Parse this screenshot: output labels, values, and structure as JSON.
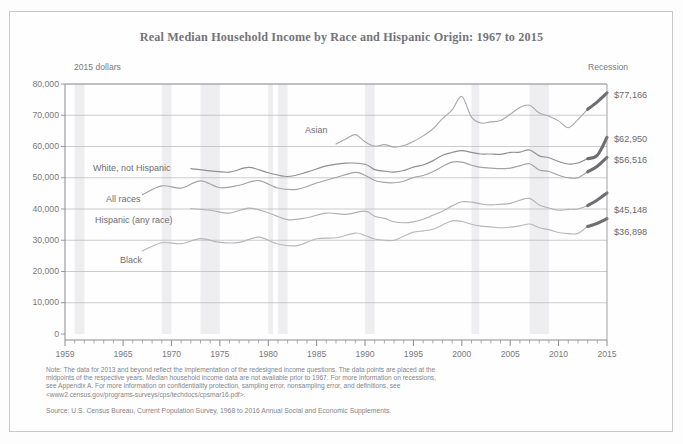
{
  "chart_data": {
    "type": "line",
    "title": "Real Median Household Income by Race and Hispanic Origin: 1967 to 2015",
    "units_label": "2015 dollars",
    "xlabel": "",
    "ylabel": "",
    "xlim": [
      1959,
      2015
    ],
    "ylim": [
      0,
      80000
    ],
    "grid": true,
    "legend_position": "inline-right",
    "legend_recession": "Recession",
    "y_ticks": [
      "0",
      "10,000",
      "20,000",
      "30,000",
      "40,000",
      "50,000",
      "60,000",
      "70,000",
      "80,000"
    ],
    "y_tick_values": [
      0,
      10000,
      20000,
      30000,
      40000,
      50000,
      60000,
      70000,
      80000
    ],
    "x_ticks": [
      "1959",
      "1965",
      "1970",
      "1975",
      "1980",
      "1985",
      "1990",
      "1995",
      "2000",
      "2005",
      "2010",
      "2015"
    ],
    "x_tick_values": [
      1959,
      1965,
      1970,
      1975,
      1980,
      1985,
      1990,
      1995,
      2000,
      2005,
      2010,
      2015
    ],
    "recession_bands": [
      [
        1960,
        1961
      ],
      [
        1969,
        1970
      ],
      [
        1973,
        1975
      ],
      [
        1980,
        1980.5
      ],
      [
        1981,
        1982
      ],
      [
        1990,
        1991
      ],
      [
        2001,
        2001.8
      ],
      [
        2007,
        2009
      ]
    ],
    "series": [
      {
        "name": "Asian",
        "label": "Asian",
        "end_value_label": "$77,166",
        "end_value": 77166,
        "color": "#a9a9ad",
        "x": [
          1987,
          1988,
          1989,
          1990,
          1991,
          1992,
          1993,
          1994,
          1995,
          1996,
          1997,
          1998,
          1999,
          2000,
          2001,
          2002,
          2003,
          2004,
          2005,
          2006,
          2007,
          2008,
          2009,
          2010,
          2011,
          2012,
          2013,
          2014,
          2015
        ],
        "values": [
          60800,
          62400,
          63800,
          61500,
          60100,
          60600,
          59800,
          60300,
          61600,
          63400,
          65600,
          68900,
          71700,
          76000,
          69400,
          67500,
          67900,
          68300,
          70300,
          72500,
          73200,
          70700,
          69700,
          68200,
          66000,
          68600,
          71900,
          74300,
          77166
        ]
      },
      {
        "name": "White, not Hispanic",
        "label": "White, not Hispanic",
        "end_value_label": "$62,950",
        "end_value": 62950,
        "color": "#8f8f94",
        "x": [
          1972,
          1974,
          1976,
          1978,
          1980,
          1982,
          1984,
          1986,
          1988,
          1990,
          1991,
          1992,
          1993,
          1994,
          1995,
          1996,
          1997,
          1998,
          1999,
          2000,
          2001,
          2002,
          2003,
          2004,
          2005,
          2006,
          2007,
          2008,
          2009,
          2010,
          2011,
          2012,
          2013,
          2014,
          2015
        ],
        "values": [
          52900,
          52200,
          51800,
          53300,
          51600,
          50400,
          51800,
          53800,
          54700,
          54300,
          52600,
          52100,
          51800,
          52300,
          53400,
          54100,
          55400,
          57200,
          58100,
          58700,
          58100,
          57600,
          57600,
          57500,
          58100,
          58200,
          58900,
          57000,
          56400,
          55200,
          54400,
          54700,
          56100,
          57200,
          62950
        ]
      },
      {
        "name": "All races",
        "label": "All races",
        "end_value_label": "$56,516",
        "end_value": 56516,
        "color": "#a3a3a8",
        "x": [
          1967,
          1969,
          1971,
          1973,
          1975,
          1977,
          1979,
          1981,
          1983,
          1985,
          1987,
          1989,
          1990,
          1991,
          1992,
          1993,
          1994,
          1995,
          1996,
          1997,
          1998,
          1999,
          2000,
          2001,
          2002,
          2003,
          2004,
          2005,
          2006,
          2007,
          2008,
          2009,
          2010,
          2011,
          2012,
          2013,
          2014,
          2015
        ],
        "values": [
          44600,
          47400,
          46700,
          49000,
          46800,
          47600,
          49100,
          46700,
          46300,
          48300,
          50100,
          51700,
          50800,
          49100,
          48500,
          48400,
          48900,
          50100,
          50700,
          51900,
          53600,
          55000,
          55000,
          54000,
          53300,
          53100,
          52900,
          53100,
          53800,
          54500,
          52500,
          52000,
          50800,
          50000,
          50000,
          51900,
          53700,
          56516
        ]
      },
      {
        "name": "Hispanic (any race)",
        "label": "Hispanic (any race)",
        "end_value_label": "$45,148",
        "end_value": 45148,
        "color": "#b2b2b6",
        "x": [
          1972,
          1974,
          1976,
          1978,
          1980,
          1982,
          1984,
          1986,
          1988,
          1990,
          1991,
          1992,
          1993,
          1994,
          1995,
          1996,
          1997,
          1998,
          1999,
          2000,
          2001,
          2002,
          2003,
          2004,
          2005,
          2006,
          2007,
          2008,
          2009,
          2010,
          2011,
          2012,
          2013,
          2014,
          2015
        ],
        "values": [
          40100,
          39600,
          38700,
          40300,
          38800,
          36600,
          37200,
          38700,
          38300,
          39300,
          37700,
          37000,
          35900,
          35600,
          35900,
          36700,
          38000,
          39300,
          41000,
          42300,
          42200,
          41600,
          41300,
          41500,
          41800,
          42800,
          43400,
          41300,
          40300,
          39600,
          39900,
          40000,
          41100,
          42900,
          45148
        ]
      },
      {
        "name": "Black",
        "label": "Black",
        "end_value_label": "$36,898",
        "end_value": 36898,
        "color": "#b8b8bc",
        "x": [
          1967,
          1969,
          1971,
          1973,
          1975,
          1977,
          1979,
          1981,
          1983,
          1985,
          1987,
          1989,
          1990,
          1991,
          1992,
          1993,
          1994,
          1995,
          1996,
          1997,
          1998,
          1999,
          2000,
          2001,
          2002,
          2003,
          2004,
          2005,
          2006,
          2007,
          2008,
          2009,
          2010,
          2011,
          2012,
          2013,
          2014,
          2015
        ],
        "values": [
          26600,
          29200,
          28900,
          30500,
          29300,
          29300,
          31000,
          28800,
          28300,
          30500,
          30800,
          32300,
          31500,
          30400,
          30000,
          30000,
          31300,
          32600,
          33000,
          33500,
          34900,
          36200,
          36000,
          35100,
          34500,
          34300,
          34000,
          34200,
          34600,
          35200,
          34000,
          33400,
          32500,
          32100,
          32200,
          34400,
          35400,
          36898
        ]
      }
    ]
  },
  "series_label_positions": [
    {
      "name": "asian",
      "left": 305,
      "top": 125
    },
    {
      "name": "white-not-hispanic",
      "left": 93,
      "top": 163
    },
    {
      "name": "all-races",
      "left": 106,
      "top": 194
    },
    {
      "name": "hispanic-any-race",
      "left": 95,
      "top": 215
    },
    {
      "name": "black",
      "left": 120,
      "top": 255
    }
  ],
  "end_value_positions": [
    {
      "name": "asian",
      "left": 614,
      "top": 90
    },
    {
      "name": "white-not-hispanic",
      "left": 614,
      "top": 134
    },
    {
      "name": "all-races",
      "left": 614,
      "top": 155
    },
    {
      "name": "hispanic-any-race",
      "left": 614,
      "top": 205
    },
    {
      "name": "black",
      "left": 614,
      "top": 227
    }
  ],
  "footnote": {
    "lines": [
      "Note: The data for 2013 and beyond reflect the implementation of the redesigned income questions. The data points are placed at the",
      "midpoints of the respective years. Median household income data are not available prior to 1967. For more information on recessions,",
      "see Appendix A. For more information on confidentiality protection, sampling error, nonsampling error, and definitions, see",
      "<www2.census.gov/programs-surveys/cps/techdocs/cpsmar16.pdf>."
    ],
    "source": "Source: U.S. Census Bureau, Current Population Survey, 1968 to 2016 Annual Social and Economic Supplements."
  },
  "colors": {
    "frame": "#c9c9cb",
    "grid": "#b6b6ba",
    "axis": "#8c8c90",
    "text": "#79797d",
    "recession_band": "#eeeef0",
    "emphasis": "#6d6d73"
  }
}
